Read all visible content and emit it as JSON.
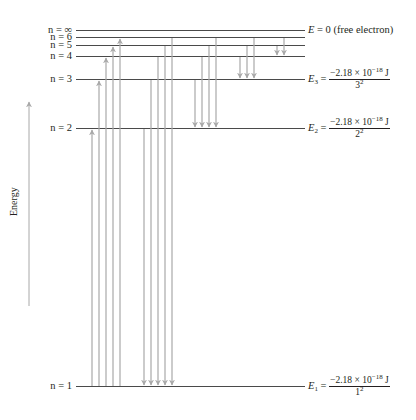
{
  "diagram": {
    "axis_label": "Energy",
    "colors": {
      "level_line": "#4a4a4a",
      "transition_arrow": "#a8a8a8",
      "text": "#231f20"
    },
    "levels": [
      {
        "n_label": "n = ∞",
        "y": 30
      },
      {
        "n_label": "n = 6",
        "y": 37
      },
      {
        "n_label": "n = 5",
        "y": 45
      },
      {
        "n_label": "n = 4",
        "y": 56
      },
      {
        "n_label": "n = 3",
        "y": 79
      },
      {
        "n_label": "n = 2",
        "y": 128
      },
      {
        "n_label": "n = 1",
        "y": 386
      }
    ],
    "energy_labels": {
      "free": {
        "symbol": "E",
        "text": " = 0 (free electron)"
      },
      "e3": {
        "symbol": "E",
        "sub": "3",
        "eq": " = ",
        "num_main": "−2.18 × 10",
        "num_exp": "−18",
        "num_unit": " J",
        "den_base": "3",
        "den_exp": "2"
      },
      "e2": {
        "symbol": "E",
        "sub": "2",
        "eq": " = ",
        "num_main": "−2.18 × 10",
        "num_exp": "−18",
        "num_unit": " J",
        "den_base": "2",
        "den_exp": "2"
      },
      "e1": {
        "symbol": "E",
        "sub": "1",
        "eq": " = ",
        "num_main": "−2.18 × 10",
        "num_exp": "−18",
        "num_unit": " J",
        "den_base": "1",
        "den_exp": "2"
      }
    },
    "transitions": [
      {
        "group": "absorption_from_1",
        "x": 92,
        "from_n": 1,
        "to_n": 2,
        "direction": "up"
      },
      {
        "group": "absorption_from_1",
        "x": 99,
        "from_n": 1,
        "to_n": 3,
        "direction": "up"
      },
      {
        "group": "absorption_from_1",
        "x": 106,
        "from_n": 1,
        "to_n": 4,
        "direction": "up"
      },
      {
        "group": "absorption_from_1",
        "x": 113,
        "from_n": 1,
        "to_n": 5,
        "direction": "up"
      },
      {
        "group": "absorption_from_1",
        "x": 120,
        "from_n": 1,
        "to_n": 6,
        "direction": "up"
      },
      {
        "group": "emission_to_1",
        "x": 144,
        "from_n": 2,
        "to_n": 1,
        "direction": "down"
      },
      {
        "group": "emission_to_1",
        "x": 151,
        "from_n": 3,
        "to_n": 1,
        "direction": "down"
      },
      {
        "group": "emission_to_1",
        "x": 158,
        "from_n": 4,
        "to_n": 1,
        "direction": "down"
      },
      {
        "group": "emission_to_1",
        "x": 165,
        "from_n": 5,
        "to_n": 1,
        "direction": "down"
      },
      {
        "group": "emission_to_1",
        "x": 172,
        "from_n": 6,
        "to_n": 1,
        "direction": "down"
      },
      {
        "group": "emission_to_2",
        "x": 195,
        "from_n": 3,
        "to_n": 2,
        "direction": "down"
      },
      {
        "group": "emission_to_2",
        "x": 202,
        "from_n": 4,
        "to_n": 2,
        "direction": "down"
      },
      {
        "group": "emission_to_2",
        "x": 209,
        "from_n": 5,
        "to_n": 2,
        "direction": "down"
      },
      {
        "group": "emission_to_2",
        "x": 216,
        "from_n": 6,
        "to_n": 2,
        "direction": "down"
      },
      {
        "group": "emission_to_3",
        "x": 240,
        "from_n": 4,
        "to_n": 3,
        "direction": "down"
      },
      {
        "group": "emission_to_3",
        "x": 247,
        "from_n": 5,
        "to_n": 3,
        "direction": "down"
      },
      {
        "group": "emission_to_3",
        "x": 254,
        "from_n": 6,
        "to_n": 3,
        "direction": "down"
      },
      {
        "group": "emission_to_4",
        "x": 277,
        "from_n": 5,
        "to_n": 4,
        "direction": "down"
      },
      {
        "group": "emission_to_4",
        "x": 284,
        "from_n": 6,
        "to_n": 4,
        "direction": "down"
      }
    ]
  }
}
